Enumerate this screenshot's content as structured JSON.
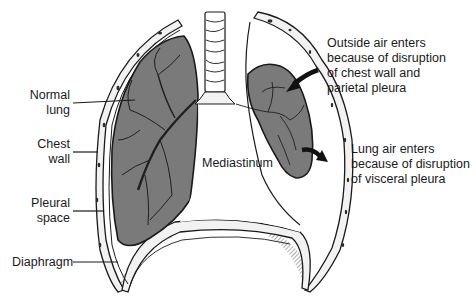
{
  "figure": {
    "colors": {
      "lung_fill": "#7a7a7a",
      "outline": "#1a1a1a",
      "pleura_fill": "#f2f2f2",
      "background": "#ffffff"
    }
  },
  "labels": {
    "normal_lung": "Normal\nlung",
    "chest_wall": "Chest\nwall",
    "pleural_space": "Pleural\nspace",
    "diaphragm": "Diaphragm",
    "mediastinum": "Mediastinum",
    "outside_air": "Outside air enters\nbecause of disruption\nof chest wall and\nparietal pleura",
    "lung_air": "Lung air enters\nbecause of disruption\nof visceral pleura"
  }
}
